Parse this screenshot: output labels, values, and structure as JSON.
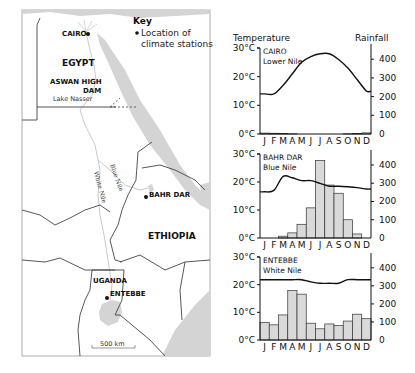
{
  "map": {
    "key_title": "Key",
    "key_line1": "Location of",
    "key_line2": "climate stations",
    "country_labels": {
      "egypt": "EGYPT",
      "ethiopia": "ETHIOPIA",
      "uganda": "UGANDA"
    },
    "dam_label_line1": "ASWAN HIGH",
    "dam_label_line2": "DAM",
    "lake_label": "Lake Nasser",
    "river_labels": {
      "blue_nile": "Blue Nile",
      "white_nile": "White Nile"
    },
    "stations": [
      {
        "name": "CAIRO"
      },
      {
        "name": "BAHR DAR"
      },
      {
        "name": "ENTEBBE"
      }
    ],
    "scale_label": "500 km",
    "colors": {
      "water": "#d4d4d4",
      "border": "#444444",
      "river": "#bbbbbb"
    }
  },
  "chart_data": [
    {
      "type": "bar",
      "station": "CAIRO",
      "region": "Lower Nile",
      "title": "CAIRO",
      "subtitle": "Lower Nile",
      "ylabel_left": "Temperature",
      "ylabel_right": "Rainfall",
      "categories": [
        "J",
        "F",
        "M",
        "A",
        "M",
        "J",
        "J",
        "A",
        "S",
        "O",
        "N",
        "D"
      ],
      "temp_ylim": [
        0,
        30
      ],
      "temp_ticks": [
        "0°C",
        "10°C",
        "20°C",
        "30°C"
      ],
      "rain_ylim": [
        0,
        460
      ],
      "rain_ticks": [
        "0",
        "100",
        "200",
        "300",
        "400"
      ],
      "series": [
        {
          "name": "Temperature (°C)",
          "kind": "line",
          "values": [
            14,
            14,
            17,
            21,
            25,
            27,
            28,
            28,
            26,
            23,
            19,
            15
          ]
        },
        {
          "name": "Rainfall (mm)",
          "kind": "bar",
          "values": [
            5,
            4,
            3,
            1,
            0,
            0,
            0,
            0,
            0,
            1,
            3,
            6
          ]
        }
      ]
    },
    {
      "type": "bar",
      "station": "BAHR DAR",
      "region": "Blue Nile",
      "title": "BAHR DAR",
      "subtitle": "Blue Nile",
      "categories": [
        "J",
        "F",
        "M",
        "A",
        "M",
        "J",
        "J",
        "A",
        "S",
        "O",
        "N",
        "D"
      ],
      "temp_ylim": [
        0,
        30
      ],
      "temp_ticks": [
        "0°C",
        "10°C",
        "20°C",
        "30°C"
      ],
      "rain_ylim": [
        0,
        460
      ],
      "rain_ticks": [
        "0",
        "100",
        "200",
        "300",
        "400"
      ],
      "series": [
        {
          "name": "Temperature (°C)",
          "kind": "line",
          "values": [
            16.5,
            17,
            22,
            21.5,
            20.5,
            20.5,
            19.5,
            18.5,
            18.5,
            18.3,
            18,
            17.5
          ]
        },
        {
          "name": "Rainfall (mm)",
          "kind": "bar",
          "values": [
            0,
            0,
            10,
            28,
            75,
            165,
            425,
            290,
            245,
            100,
            22,
            0
          ]
        }
      ]
    },
    {
      "type": "bar",
      "station": "ENTEBBE",
      "region": "White Nile",
      "title": "ENTEBBE",
      "subtitle": "White Nile",
      "categories": [
        "J",
        "F",
        "M",
        "A",
        "M",
        "J",
        "J",
        "A",
        "S",
        "O",
        "N",
        "D"
      ],
      "temp_ylim": [
        0,
        30
      ],
      "temp_ticks": [
        "0°C",
        "10°C",
        "20°C",
        "30°C"
      ],
      "rain_ylim": [
        0,
        460
      ],
      "rain_ticks": [
        "0",
        "100",
        "200",
        "300",
        "400"
      ],
      "series": [
        {
          "name": "Temperature (°C)",
          "kind": "line",
          "values": [
            21.8,
            21.8,
            21.8,
            21.8,
            21.8,
            21,
            20.5,
            20.5,
            20.5,
            21.8,
            21.8,
            21.8
          ]
        },
        {
          "name": "Rainfall (mm)",
          "kind": "bar",
          "values": [
            98,
            84,
            139,
            275,
            254,
            93,
            62,
            89,
            80,
            105,
            143,
            118
          ]
        }
      ]
    }
  ]
}
